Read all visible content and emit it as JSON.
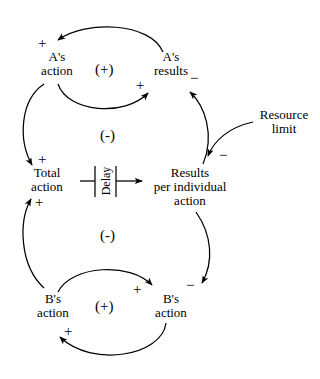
{
  "diagram": {
    "type": "causal-loop-diagram",
    "background_color": "#ffffff",
    "stroke_color": "#000000",
    "nodes": [
      {
        "id": "as-action",
        "lines": [
          "A's",
          "action"
        ]
      },
      {
        "id": "as-results",
        "lines": [
          "A's",
          "results"
        ]
      },
      {
        "id": "total-action",
        "lines": [
          "Total",
          "action"
        ]
      },
      {
        "id": "results-per-individual",
        "lines": [
          "Results",
          "per individual",
          "action"
        ]
      },
      {
        "id": "resource-limit",
        "lines": [
          "Resource",
          "limit"
        ]
      },
      {
        "id": "bs-action-left",
        "lines": [
          "B's",
          "action"
        ]
      },
      {
        "id": "bs-action-right",
        "lines": [
          "B's",
          "action"
        ]
      }
    ],
    "delay": {
      "label": "Delay"
    },
    "loop_marks": [
      {
        "id": "upper-reinforcing",
        "label": "(+)"
      },
      {
        "id": "upper-balancing",
        "label": "(-)"
      },
      {
        "id": "lower-balancing",
        "label": "(-)"
      },
      {
        "id": "lower-reinforcing",
        "label": "(+)"
      }
    ],
    "link_polarities": [
      {
        "id": "to-as-action",
        "sign": "+"
      },
      {
        "id": "to-as-results",
        "sign": "+"
      },
      {
        "id": "to-as-results-limit",
        "sign": "−"
      },
      {
        "id": "to-total-action",
        "sign": "+"
      },
      {
        "id": "to-total-action-from-b",
        "sign": "+"
      },
      {
        "id": "to-results-per-individual",
        "sign": "−"
      },
      {
        "id": "to-bs-action-right",
        "sign": "+"
      },
      {
        "id": "to-bs-action-right-limit",
        "sign": "−"
      },
      {
        "id": "to-bs-action-left",
        "sign": "+"
      }
    ]
  }
}
